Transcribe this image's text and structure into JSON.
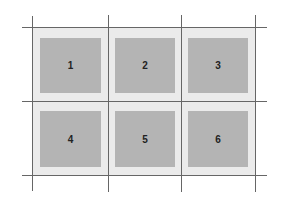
{
  "diagram": {
    "type": "grid-layout",
    "rows": 2,
    "columns": 3,
    "cells": [
      {
        "label": "1"
      },
      {
        "label": "2"
      },
      {
        "label": "3"
      },
      {
        "label": "4"
      },
      {
        "label": "5"
      },
      {
        "label": "6"
      }
    ],
    "colors": {
      "gridline": "#666666",
      "cell_background": "#ebebeb",
      "box_fill": "#b4b4b4",
      "label": "#222222"
    }
  }
}
